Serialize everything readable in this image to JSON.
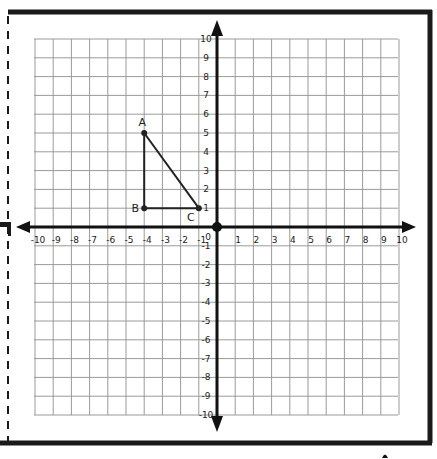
{
  "diagram": {
    "type": "coordinate-plane",
    "x_range": [
      -10,
      10
    ],
    "y_range": [
      -10,
      10
    ],
    "x_tick_labels": [
      "-10",
      "-9",
      "-8",
      "-7",
      "-6",
      "-5",
      "-4",
      "-3",
      "-2",
      "-1",
      "1",
      "2",
      "3",
      "4",
      "5",
      "6",
      "7",
      "8",
      "9",
      "10"
    ],
    "y_tick_labels": [
      "10",
      "9",
      "8",
      "7",
      "6",
      "5",
      "4",
      "3",
      "2",
      "1",
      "-1",
      "-2",
      "-3",
      "-4",
      "-5",
      "-6",
      "-7",
      "-8",
      "-9",
      "-10"
    ],
    "origin_label": "0",
    "points": [
      {
        "name": "A",
        "x": -4,
        "y": 5
      },
      {
        "name": "B",
        "x": -4,
        "y": 1
      },
      {
        "name": "C",
        "x": -1,
        "y": 1
      }
    ],
    "segments": [
      [
        "A",
        "B"
      ],
      [
        "B",
        "C"
      ],
      [
        "C",
        "A"
      ]
    ],
    "colors": {
      "grid": "#9a9a9a",
      "axis": "#111111",
      "frame": "#1a1a1a",
      "triangle": "#222222"
    }
  }
}
